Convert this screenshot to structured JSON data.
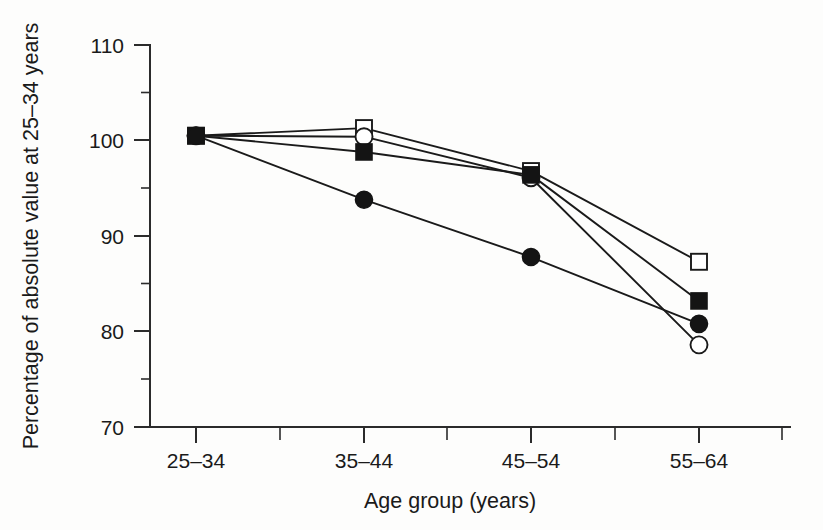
{
  "chart_data": {
    "type": "line",
    "title": "",
    "xlabel": "Age group (years)",
    "ylabel": "Percentage of absolute value at 25–34 years",
    "categories": [
      "25–34",
      "35–44",
      "45–54",
      "55–64"
    ],
    "ylim": [
      70,
      110
    ],
    "yticks": [
      70,
      80,
      90,
      100,
      110
    ],
    "ytick_labels": [
      "70",
      "80",
      "90",
      "100",
      "110"
    ],
    "y_minor_ticks": [
      75,
      85,
      95,
      105
    ],
    "grid": false,
    "legend": "none",
    "series": [
      {
        "name": "open-square",
        "marker": "open-square",
        "values": [
          100.5,
          101.3,
          96.8,
          87.3
        ]
      },
      {
        "name": "open-circle",
        "marker": "open-circle",
        "values": [
          100.5,
          100.4,
          96.1,
          78.6
        ]
      },
      {
        "name": "filled-square",
        "marker": "filled-square",
        "values": [
          100.5,
          98.8,
          96.4,
          83.2
        ]
      },
      {
        "name": "filled-circle",
        "marker": "filled-circle",
        "values": [
          100.5,
          93.8,
          87.8,
          80.8
        ]
      }
    ]
  },
  "axes": {
    "y_label": "Percentage of absolute value at 25–34 years",
    "x_label": "Age group (years)",
    "y_tick_labels": [
      "110",
      "100",
      "90",
      "80",
      "70"
    ],
    "x_tick_labels": [
      "25–34",
      "35–44",
      "45–54",
      "55–64"
    ]
  },
  "colors": {
    "axis": "#2b2b2b",
    "line": "#1a1a1a",
    "marker_fill": "#141414",
    "marker_open": "#ffffff",
    "background": "#fdfdfc"
  }
}
